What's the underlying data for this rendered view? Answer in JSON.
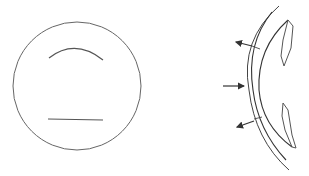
{
  "diagram": {
    "background": "#ffffff",
    "stroke_color": "#555555",
    "dark_stroke_color": "#333333",
    "panels": [
      {
        "id": "left",
        "description": "Circle containing an upper arc and a lower horizontal line",
        "elements": [
          "outer-circle",
          "upper-arc",
          "lower-line"
        ]
      },
      {
        "id": "right",
        "description": "Curved double-line membrane with two enclosed flap shapes on the right and three arrows on the left",
        "arrows": [
          {
            "name": "upper-outward-arrow",
            "direction": "up-left"
          },
          {
            "name": "middle-inward-arrow",
            "direction": "right"
          },
          {
            "name": "lower-outward-arrow",
            "direction": "down-left"
          }
        ]
      }
    ]
  }
}
